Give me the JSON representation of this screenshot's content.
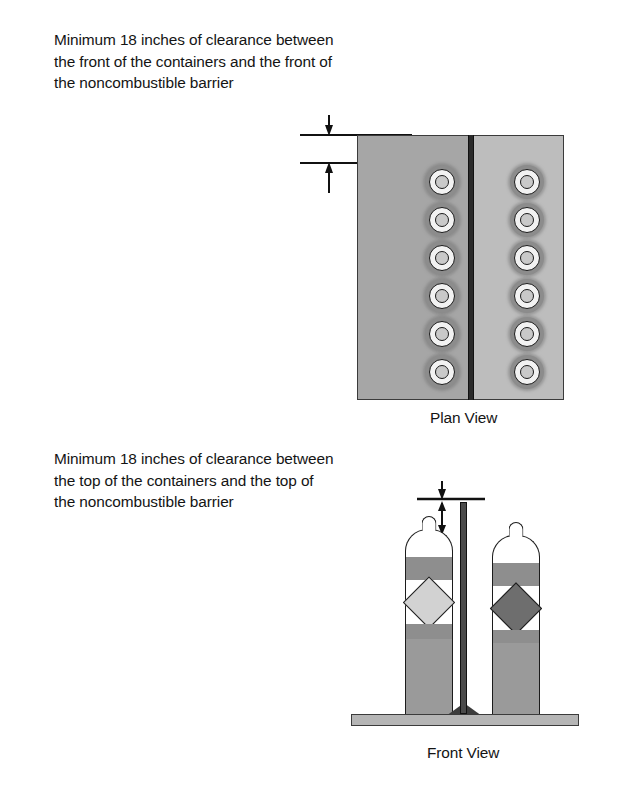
{
  "figure": {
    "callouts": {
      "plan": "Minimum 18 inches of clearance between\nthe front of the containers and the front of\nthe noncombustible barrier",
      "front": "Minimum 18 inches of clearance between\nthe top of the containers and the top of\nthe noncombustible barrier"
    },
    "captions": {
      "plan_view": "Plan View",
      "front_view": "Front View"
    },
    "dimension": {
      "value": "18",
      "unit": "inches",
      "label": "Minimum 18 inches of clearance"
    },
    "plan_view": {
      "containers_per_column": 6,
      "columns": 2,
      "panel_left_color": "#a6a6a6",
      "panel_right_color": "#bdbdbd",
      "barrier_color": "#2a2a2a"
    },
    "front_view": {
      "containers": 2,
      "left_container_label_color": "#d2d2d2",
      "right_container_label_color": "#6e6e6e",
      "body_color": "#9a9a9a",
      "band_color": "#8e8e8e",
      "barrier_color": "#4a4a4a",
      "base_color": "#b5b5b5"
    }
  }
}
